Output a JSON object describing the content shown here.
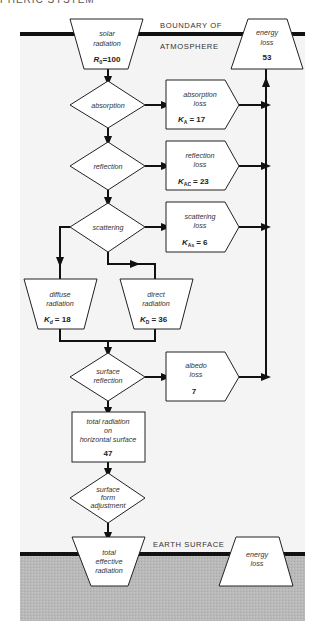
{
  "header": {
    "caption": "PHERIC SYSTEM"
  },
  "boundaries": {
    "top_line_1": "BOUNDARY OF",
    "top_line_2": "ATMOSPHERE",
    "bottom": "EARTH SURFACE"
  },
  "colors": {
    "atmosphere_bg": "#f4f4f4",
    "ground_bg": "#b9b9b9",
    "line": "#111111",
    "box_fill": "#ffffff"
  },
  "nodes": {
    "solar": {
      "l1": "solar",
      "l2": "radiation",
      "val": "R₀=100"
    },
    "energy_loss_top": {
      "l1": "energy",
      "l2": "loss",
      "val": "53"
    },
    "absorption": {
      "label": "absorption"
    },
    "absorption_loss": {
      "l1": "absorption",
      "l2": "loss",
      "val": "Kₐ = 17",
      "sym": "K",
      "sub": "A",
      "num": "= 17"
    },
    "reflection": {
      "label": "reflection"
    },
    "reflection_loss": {
      "l1": "reflection",
      "l2": "loss",
      "sym": "K",
      "sub": "AC",
      "num": "= 23"
    },
    "scattering": {
      "label": "scattering"
    },
    "scattering_loss": {
      "l1": "scattering",
      "l2": "loss",
      "sym": "K",
      "sub": "As",
      "num": "= 6"
    },
    "diffuse": {
      "l1": "diffuse",
      "l2": "radiation",
      "sym": "K",
      "sub": "d",
      "num": "= 18"
    },
    "direct": {
      "l1": "direct",
      "l2": "radiation",
      "sym": "K",
      "sub": "D",
      "num": "= 36"
    },
    "surface_reflection": {
      "l1": "surface",
      "l2": "reflection"
    },
    "albedo_loss": {
      "l1": "albedo",
      "l2": "loss",
      "val": "7"
    },
    "total_radiation": {
      "l1": "total radiation",
      "l2": "on",
      "l3": "horizontal surface",
      "val": "47"
    },
    "surface_form": {
      "l1": "surface",
      "l2": "form",
      "l3": "adjustment"
    },
    "total_effective": {
      "l1": "total",
      "l2": "effective",
      "l3": "radiation"
    },
    "energy_loss_bottom": {
      "l1": "energy",
      "l2": "loss"
    }
  },
  "solar_sym": "R",
  "solar_sub": "0",
  "solar_num": "=100"
}
